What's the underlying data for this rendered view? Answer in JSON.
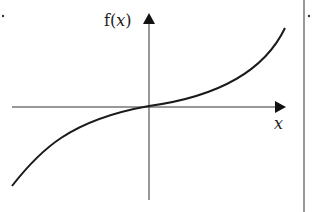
{
  "diagram": {
    "type": "function-graph",
    "y_axis_label_prefix": "f(",
    "y_axis_label_var": "x",
    "y_axis_label_suffix": ")",
    "x_axis_label": "x",
    "curve": "odd cubic-like increasing function through origin",
    "colors": {
      "ink": "#1a1a1a",
      "axis": "#333333",
      "background": "#ffffff"
    }
  }
}
